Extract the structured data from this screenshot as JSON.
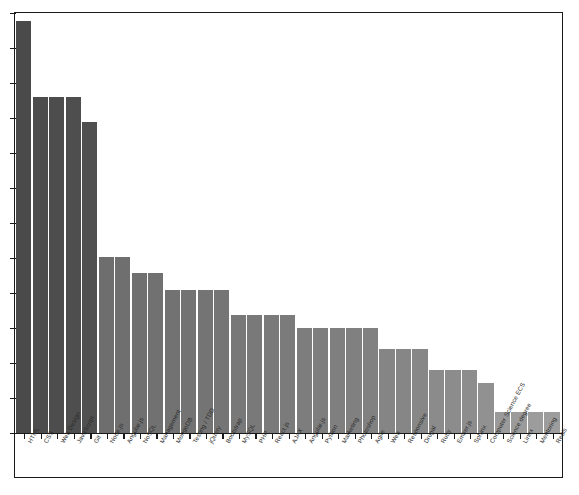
{
  "chart_data": {
    "type": "bar",
    "title": "",
    "subtitle": "",
    "xlabel": "",
    "ylabel": "",
    "grid": false,
    "legend": null,
    "axis": {
      "y_tick_labels_visible": false,
      "y_tick_count": 13,
      "ylim": [
        0,
        100
      ],
      "x_tick_labels_rotated_deg": -62
    },
    "categories": [
      "HTML",
      "CSS",
      "Web Design",
      "JavaScript",
      "Git",
      "Node.js",
      "Angular.js",
      "NoSQL",
      "Management",
      "MongoDB",
      "Testing / TDD",
      "jQuery",
      "Bootstrap",
      "MySQL",
      "PHP",
      "React.js",
      "AJAX",
      "Angular.js",
      "Python",
      "Marketing",
      "Photoshop",
      "Agile",
      "Web",
      "Responsive",
      "Drupal",
      "Ruby",
      "Ember.js",
      "Sphinx",
      "Computer Science ECS",
      "Science degree",
      "Linux",
      "Mentoring",
      "Redis"
    ],
    "values": [
      98,
      80,
      80,
      80,
      74,
      42,
      42,
      38,
      38,
      34,
      34,
      34,
      34,
      28,
      28,
      28,
      28,
      25,
      25,
      25,
      25,
      25,
      20,
      20,
      20,
      15,
      15,
      15,
      12,
      5,
      5,
      5,
      5
    ],
    "bar_colors": [
      "#4a4a4a",
      "#4c4c4c",
      "#4d4d4d",
      "#4e4e4e",
      "#505050",
      "#6e6e6e",
      "#6f6f6f",
      "#707070",
      "#717171",
      "#727272",
      "#737373",
      "#747474",
      "#757575",
      "#787878",
      "#797979",
      "#7a7a7a",
      "#7b7b7b",
      "#7d7d7d",
      "#7e7e7e",
      "#7f7f7f",
      "#808080",
      "#818181",
      "#858585",
      "#868686",
      "#878787",
      "#8b8b8b",
      "#8c8c8c",
      "#8d8d8d",
      "#919191",
      "#9a9a9a",
      "#9b9b9b",
      "#9c9c9c",
      "#9d9d9d"
    ]
  },
  "style": {
    "frame_color": "#1a1a1a",
    "background": "#ffffff",
    "bar_gap_color": "#ffffff",
    "tick_color": "#1a1a1a",
    "label_color": "#2b2b2b"
  }
}
